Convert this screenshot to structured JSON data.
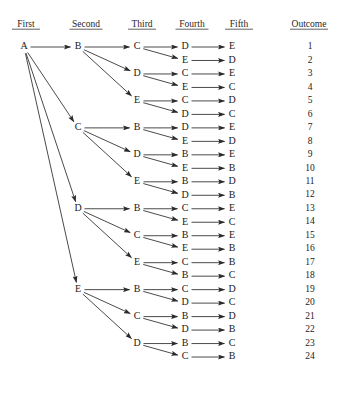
{
  "headers": [
    {
      "label": "First",
      "x": 26
    },
    {
      "label": "Second",
      "x": 86
    },
    {
      "label": "Third",
      "x": 142
    },
    {
      "label": "Fourth",
      "x": 192
    },
    {
      "label": "Fifth",
      "x": 239
    },
    {
      "label": "Outcome",
      "x": 309
    }
  ],
  "header_y": 27,
  "columns": {
    "first": 24,
    "second": 78,
    "third": 137,
    "fourth": 185,
    "fifth": 232,
    "outcome": 310
  },
  "layout": {
    "row_top": 47,
    "row_step": 13.48,
    "rows": 24,
    "width": 347,
    "height": 412
  },
  "colors": {
    "text": "#1a1a1a",
    "line": "#2a2a2a",
    "background": "#ffffff",
    "header_rule": "#1f1f1f"
  },
  "nodes": {
    "first": [
      {
        "label": "A",
        "row": 1
      }
    ],
    "second": [
      {
        "label": "B",
        "row": 1
      },
      {
        "label": "C",
        "row": 7
      },
      {
        "label": "D",
        "row": 13
      },
      {
        "label": "E",
        "row": 19
      }
    ],
    "third": [
      {
        "label": "C",
        "row": 1
      },
      {
        "label": "D",
        "row": 3
      },
      {
        "label": "E",
        "row": 5
      },
      {
        "label": "B",
        "row": 7
      },
      {
        "label": "D",
        "row": 9
      },
      {
        "label": "E",
        "row": 11
      },
      {
        "label": "B",
        "row": 13
      },
      {
        "label": "C",
        "row": 15
      },
      {
        "label": "E",
        "row": 17
      },
      {
        "label": "B",
        "row": 19
      },
      {
        "label": "C",
        "row": 21
      },
      {
        "label": "D",
        "row": 23
      }
    ],
    "fourth": [
      {
        "label": "D",
        "row": 1
      },
      {
        "label": "E",
        "row": 2
      },
      {
        "label": "C",
        "row": 3
      },
      {
        "label": "E",
        "row": 4
      },
      {
        "label": "C",
        "row": 5
      },
      {
        "label": "D",
        "row": 6
      },
      {
        "label": "D",
        "row": 7
      },
      {
        "label": "E",
        "row": 8
      },
      {
        "label": "B",
        "row": 9
      },
      {
        "label": "E",
        "row": 10
      },
      {
        "label": "B",
        "row": 11
      },
      {
        "label": "D",
        "row": 12
      },
      {
        "label": "C",
        "row": 13
      },
      {
        "label": "E",
        "row": 14
      },
      {
        "label": "B",
        "row": 15
      },
      {
        "label": "E",
        "row": 16
      },
      {
        "label": "C",
        "row": 17
      },
      {
        "label": "B",
        "row": 18
      },
      {
        "label": "C",
        "row": 19
      },
      {
        "label": "D",
        "row": 20
      },
      {
        "label": "B",
        "row": 21
      },
      {
        "label": "D",
        "row": 22
      },
      {
        "label": "B",
        "row": 23
      },
      {
        "label": "C",
        "row": 24
      }
    ],
    "fifth": [
      {
        "label": "E",
        "row": 1
      },
      {
        "label": "D",
        "row": 2
      },
      {
        "label": "E",
        "row": 3
      },
      {
        "label": "C",
        "row": 4
      },
      {
        "label": "D",
        "row": 5
      },
      {
        "label": "C",
        "row": 6
      },
      {
        "label": "E",
        "row": 7
      },
      {
        "label": "D",
        "row": 8
      },
      {
        "label": "E",
        "row": 9
      },
      {
        "label": "B",
        "row": 10
      },
      {
        "label": "D",
        "row": 11
      },
      {
        "label": "B",
        "row": 12
      },
      {
        "label": "E",
        "row": 13
      },
      {
        "label": "C",
        "row": 14
      },
      {
        "label": "E",
        "row": 15
      },
      {
        "label": "B",
        "row": 16
      },
      {
        "label": "B",
        "row": 17
      },
      {
        "label": "C",
        "row": 18
      },
      {
        "label": "D",
        "row": 19
      },
      {
        "label": "C",
        "row": 20
      },
      {
        "label": "D",
        "row": 21
      },
      {
        "label": "B",
        "row": 22
      },
      {
        "label": "C",
        "row": 23
      },
      {
        "label": "B",
        "row": 24
      }
    ]
  },
  "outcomes": [
    {
      "value": "1",
      "row": 1
    },
    {
      "value": "2",
      "row": 2
    },
    {
      "value": "3",
      "row": 3
    },
    {
      "value": "4",
      "row": 4
    },
    {
      "value": "5",
      "row": 5
    },
    {
      "value": "6",
      "row": 6
    },
    {
      "value": "7",
      "row": 7
    },
    {
      "value": "8",
      "row": 8
    },
    {
      "value": "9",
      "row": 9
    },
    {
      "value": "10",
      "row": 10
    },
    {
      "value": "11",
      "row": 11
    },
    {
      "value": "12",
      "row": 12
    },
    {
      "value": "13",
      "row": 13
    },
    {
      "value": "14",
      "row": 14
    },
    {
      "value": "15",
      "row": 15
    },
    {
      "value": "16",
      "row": 16
    },
    {
      "value": "17",
      "row": 17
    },
    {
      "value": "18",
      "row": 18
    },
    {
      "value": "19",
      "row": 19
    },
    {
      "value": "20",
      "row": 20
    },
    {
      "value": "21",
      "row": 21
    },
    {
      "value": "22",
      "row": 22
    },
    {
      "value": "23",
      "row": 23
    },
    {
      "value": "24",
      "row": 24
    }
  ],
  "edges": [
    {
      "from_col": "first",
      "from_row": 1,
      "to_col": "second",
      "to_row": 1
    },
    {
      "from_col": "first",
      "from_row": 1,
      "to_col": "second",
      "to_row": 7
    },
    {
      "from_col": "first",
      "from_row": 1,
      "to_col": "second",
      "to_row": 13
    },
    {
      "from_col": "first",
      "from_row": 1,
      "to_col": "second",
      "to_row": 19
    },
    {
      "from_col": "second",
      "from_row": 1,
      "to_col": "third",
      "to_row": 1
    },
    {
      "from_col": "second",
      "from_row": 1,
      "to_col": "third",
      "to_row": 3
    },
    {
      "from_col": "second",
      "from_row": 1,
      "to_col": "third",
      "to_row": 5
    },
    {
      "from_col": "second",
      "from_row": 7,
      "to_col": "third",
      "to_row": 7
    },
    {
      "from_col": "second",
      "from_row": 7,
      "to_col": "third",
      "to_row": 9
    },
    {
      "from_col": "second",
      "from_row": 7,
      "to_col": "third",
      "to_row": 11
    },
    {
      "from_col": "second",
      "from_row": 13,
      "to_col": "third",
      "to_row": 13
    },
    {
      "from_col": "second",
      "from_row": 13,
      "to_col": "third",
      "to_row": 15
    },
    {
      "from_col": "second",
      "from_row": 13,
      "to_col": "third",
      "to_row": 17
    },
    {
      "from_col": "second",
      "from_row": 19,
      "to_col": "third",
      "to_row": 19
    },
    {
      "from_col": "second",
      "from_row": 19,
      "to_col": "third",
      "to_row": 21
    },
    {
      "from_col": "second",
      "from_row": 19,
      "to_col": "third",
      "to_row": 23
    },
    {
      "from_col": "third",
      "from_row": 1,
      "to_col": "fourth",
      "to_row": 1
    },
    {
      "from_col": "third",
      "from_row": 1,
      "to_col": "fourth",
      "to_row": 2
    },
    {
      "from_col": "third",
      "from_row": 3,
      "to_col": "fourth",
      "to_row": 3
    },
    {
      "from_col": "third",
      "from_row": 3,
      "to_col": "fourth",
      "to_row": 4
    },
    {
      "from_col": "third",
      "from_row": 5,
      "to_col": "fourth",
      "to_row": 5
    },
    {
      "from_col": "third",
      "from_row": 5,
      "to_col": "fourth",
      "to_row": 6
    },
    {
      "from_col": "third",
      "from_row": 7,
      "to_col": "fourth",
      "to_row": 7
    },
    {
      "from_col": "third",
      "from_row": 7,
      "to_col": "fourth",
      "to_row": 8
    },
    {
      "from_col": "third",
      "from_row": 9,
      "to_col": "fourth",
      "to_row": 9
    },
    {
      "from_col": "third",
      "from_row": 9,
      "to_col": "fourth",
      "to_row": 10
    },
    {
      "from_col": "third",
      "from_row": 11,
      "to_col": "fourth",
      "to_row": 11
    },
    {
      "from_col": "third",
      "from_row": 11,
      "to_col": "fourth",
      "to_row": 12
    },
    {
      "from_col": "third",
      "from_row": 13,
      "to_col": "fourth",
      "to_row": 13
    },
    {
      "from_col": "third",
      "from_row": 13,
      "to_col": "fourth",
      "to_row": 14
    },
    {
      "from_col": "third",
      "from_row": 15,
      "to_col": "fourth",
      "to_row": 15
    },
    {
      "from_col": "third",
      "from_row": 15,
      "to_col": "fourth",
      "to_row": 16
    },
    {
      "from_col": "third",
      "from_row": 17,
      "to_col": "fourth",
      "to_row": 17
    },
    {
      "from_col": "third",
      "from_row": 17,
      "to_col": "fourth",
      "to_row": 18
    },
    {
      "from_col": "third",
      "from_row": 19,
      "to_col": "fourth",
      "to_row": 19
    },
    {
      "from_col": "third",
      "from_row": 19,
      "to_col": "fourth",
      "to_row": 20
    },
    {
      "from_col": "third",
      "from_row": 21,
      "to_col": "fourth",
      "to_row": 21
    },
    {
      "from_col": "third",
      "from_row": 21,
      "to_col": "fourth",
      "to_row": 22
    },
    {
      "from_col": "third",
      "from_row": 23,
      "to_col": "fourth",
      "to_row": 23
    },
    {
      "from_col": "third",
      "from_row": 23,
      "to_col": "fourth",
      "to_row": 24
    },
    {
      "from_col": "fourth",
      "from_row": 1,
      "to_col": "fifth",
      "to_row": 1
    },
    {
      "from_col": "fourth",
      "from_row": 2,
      "to_col": "fifth",
      "to_row": 2
    },
    {
      "from_col": "fourth",
      "from_row": 3,
      "to_col": "fifth",
      "to_row": 3
    },
    {
      "from_col": "fourth",
      "from_row": 4,
      "to_col": "fifth",
      "to_row": 4
    },
    {
      "from_col": "fourth",
      "from_row": 5,
      "to_col": "fifth",
      "to_row": 5
    },
    {
      "from_col": "fourth",
      "from_row": 6,
      "to_col": "fifth",
      "to_row": 6
    },
    {
      "from_col": "fourth",
      "from_row": 7,
      "to_col": "fifth",
      "to_row": 7
    },
    {
      "from_col": "fourth",
      "from_row": 8,
      "to_col": "fifth",
      "to_row": 8
    },
    {
      "from_col": "fourth",
      "from_row": 9,
      "to_col": "fifth",
      "to_row": 9
    },
    {
      "from_col": "fourth",
      "from_row": 10,
      "to_col": "fifth",
      "to_row": 10
    },
    {
      "from_col": "fourth",
      "from_row": 11,
      "to_col": "fifth",
      "to_row": 11
    },
    {
      "from_col": "fourth",
      "from_row": 12,
      "to_col": "fifth",
      "to_row": 12
    },
    {
      "from_col": "fourth",
      "from_row": 13,
      "to_col": "fifth",
      "to_row": 13
    },
    {
      "from_col": "fourth",
      "from_row": 14,
      "to_col": "fifth",
      "to_row": 14
    },
    {
      "from_col": "fourth",
      "from_row": 15,
      "to_col": "fifth",
      "to_row": 15
    },
    {
      "from_col": "fourth",
      "from_row": 16,
      "to_col": "fifth",
      "to_row": 16
    },
    {
      "from_col": "fourth",
      "from_row": 17,
      "to_col": "fifth",
      "to_row": 17
    },
    {
      "from_col": "fourth",
      "from_row": 18,
      "to_col": "fifth",
      "to_row": 18
    },
    {
      "from_col": "fourth",
      "from_row": 19,
      "to_col": "fifth",
      "to_row": 19
    },
    {
      "from_col": "fourth",
      "from_row": 20,
      "to_col": "fifth",
      "to_row": 20
    },
    {
      "from_col": "fourth",
      "from_row": 21,
      "to_col": "fifth",
      "to_row": 21
    },
    {
      "from_col": "fourth",
      "from_row": 22,
      "to_col": "fifth",
      "to_row": 22
    },
    {
      "from_col": "fourth",
      "from_row": 23,
      "to_col": "fifth",
      "to_row": 23
    },
    {
      "from_col": "fourth",
      "from_row": 24,
      "to_col": "fifth",
      "to_row": 24
    }
  ],
  "chart_data": {
    "type": "diagram",
    "subtype": "tree-diagram",
    "title": "",
    "stage_labels": [
      "First",
      "Second",
      "Third",
      "Fourth",
      "Fifth",
      "Outcome"
    ],
    "root": "A",
    "branching_factors": [
      4,
      3,
      2,
      1
    ],
    "total_outcomes": 24,
    "paths": [
      {
        "outcome": 1,
        "sequence": [
          "A",
          "B",
          "C",
          "D",
          "E"
        ]
      },
      {
        "outcome": 2,
        "sequence": [
          "A",
          "B",
          "C",
          "E",
          "D"
        ]
      },
      {
        "outcome": 3,
        "sequence": [
          "A",
          "B",
          "D",
          "C",
          "E"
        ]
      },
      {
        "outcome": 4,
        "sequence": [
          "A",
          "B",
          "D",
          "E",
          "C"
        ]
      },
      {
        "outcome": 5,
        "sequence": [
          "A",
          "B",
          "E",
          "C",
          "D"
        ]
      },
      {
        "outcome": 6,
        "sequence": [
          "A",
          "B",
          "E",
          "D",
          "C"
        ]
      },
      {
        "outcome": 7,
        "sequence": [
          "A",
          "C",
          "B",
          "D",
          "E"
        ]
      },
      {
        "outcome": 8,
        "sequence": [
          "A",
          "C",
          "B",
          "E",
          "D"
        ]
      },
      {
        "outcome": 9,
        "sequence": [
          "A",
          "C",
          "D",
          "B",
          "E"
        ]
      },
      {
        "outcome": 10,
        "sequence": [
          "A",
          "C",
          "D",
          "E",
          "B"
        ]
      },
      {
        "outcome": 11,
        "sequence": [
          "A",
          "C",
          "E",
          "B",
          "D"
        ]
      },
      {
        "outcome": 12,
        "sequence": [
          "A",
          "C",
          "E",
          "D",
          "B"
        ]
      },
      {
        "outcome": 13,
        "sequence": [
          "A",
          "D",
          "B",
          "C",
          "E"
        ]
      },
      {
        "outcome": 14,
        "sequence": [
          "A",
          "D",
          "B",
          "E",
          "C"
        ]
      },
      {
        "outcome": 15,
        "sequence": [
          "A",
          "D",
          "C",
          "B",
          "E"
        ]
      },
      {
        "outcome": 16,
        "sequence": [
          "A",
          "D",
          "C",
          "E",
          "B"
        ]
      },
      {
        "outcome": 17,
        "sequence": [
          "A",
          "D",
          "E",
          "C",
          "B"
        ]
      },
      {
        "outcome": 18,
        "sequence": [
          "A",
          "D",
          "E",
          "B",
          "C"
        ]
      },
      {
        "outcome": 19,
        "sequence": [
          "A",
          "E",
          "B",
          "C",
          "D"
        ]
      },
      {
        "outcome": 20,
        "sequence": [
          "A",
          "E",
          "B",
          "D",
          "C"
        ]
      },
      {
        "outcome": 21,
        "sequence": [
          "A",
          "E",
          "C",
          "B",
          "D"
        ]
      },
      {
        "outcome": 22,
        "sequence": [
          "A",
          "E",
          "C",
          "D",
          "B"
        ]
      },
      {
        "outcome": 23,
        "sequence": [
          "A",
          "E",
          "D",
          "B",
          "C"
        ]
      },
      {
        "outcome": 24,
        "sequence": [
          "A",
          "E",
          "D",
          "C",
          "B"
        ]
      }
    ]
  }
}
